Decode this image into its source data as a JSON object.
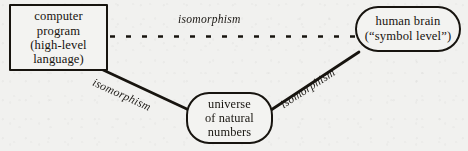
{
  "figure": {
    "background_color": "#f1f1ef",
    "ink_color": "#17140f"
  },
  "nodes": [
    {
      "id": "computer-program",
      "shape": "rectangle",
      "lines": [
        "computer",
        "program",
        "(high-level",
        "language)"
      ]
    },
    {
      "id": "human-brain",
      "shape": "rounded-stadium",
      "lines": [
        "human brain",
        "(“symbol level”)"
      ]
    },
    {
      "id": "natural-numbers",
      "shape": "rounded-stadium",
      "lines": [
        "universe",
        "of natural",
        "numbers"
      ]
    }
  ],
  "edges": [
    {
      "id": "program-to-brain",
      "label": "isomorphism",
      "style": "dashed",
      "from": "computer-program",
      "to": "human-brain"
    },
    {
      "id": "program-to-numbers",
      "label": "isomorphism",
      "style": "solid",
      "from": "computer-program",
      "to": "natural-numbers"
    },
    {
      "id": "numbers-to-brain",
      "label": "isomorphism",
      "style": "solid",
      "from": "natural-numbers",
      "to": "human-brain"
    }
  ]
}
